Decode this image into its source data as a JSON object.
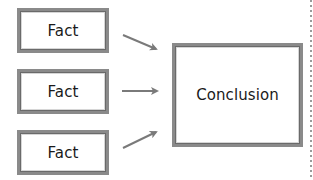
{
  "diagram": {
    "facts": [
      {
        "label": "Fact"
      },
      {
        "label": "Fact"
      },
      {
        "label": "Fact"
      }
    ],
    "conclusion": {
      "label": "Conclusion"
    },
    "arrows": [
      {
        "from": "fact-1",
        "to": "conclusion",
        "direction": "down-right"
      },
      {
        "from": "fact-2",
        "to": "conclusion",
        "direction": "right"
      },
      {
        "from": "fact-3",
        "to": "conclusion",
        "direction": "up-right"
      }
    ],
    "colors": {
      "border": "#8a8a8a",
      "arrow": "#7a7a7a",
      "text": "#1a1a1a",
      "divider": "#9a9a9a"
    }
  }
}
